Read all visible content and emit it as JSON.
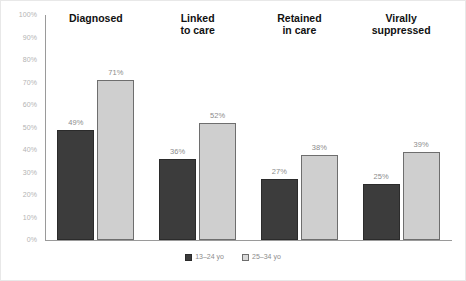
{
  "chart_data": {
    "type": "bar",
    "title": "",
    "subtitle": "",
    "xlabel": "",
    "ylabel": "",
    "ylim": [
      0,
      100
    ],
    "grid": false,
    "legend_position": "bottom-center",
    "ytick_labels": [
      "100%",
      "90%",
      "80%",
      "70%",
      "60%",
      "50%",
      "40%",
      "30%",
      "20%",
      "10%",
      "0%"
    ],
    "ytick_values": [
      100,
      90,
      80,
      70,
      60,
      50,
      40,
      30,
      20,
      10,
      0
    ],
    "categories": [
      "Diagnosed",
      "Linked\nto care",
      "Retained\nin care",
      "Virally\nsuppressed"
    ],
    "series": [
      {
        "name": "13–24 yo",
        "color": "#3c3c3c",
        "values": [
          49,
          36,
          27,
          25
        ],
        "labels": [
          "49%",
          "36%",
          "27%",
          "25%"
        ]
      },
      {
        "name": "25–34 yo",
        "color": "#cfcfcf",
        "values": [
          71,
          52,
          38,
          39
        ],
        "labels": [
          "71%",
          "52%",
          "38%",
          "39%"
        ]
      }
    ]
  },
  "legend": {
    "items": [
      {
        "label": "13–24 yo"
      },
      {
        "label": "25–34 yo"
      }
    ]
  },
  "colors": {
    "series_13_24": "#3c3c3c",
    "series_25_34": "#cfcfcf",
    "axis": "#9a9a9a",
    "tick_text": "#b3b3b3",
    "data_label_text": "#8c8c8c",
    "category_title_text": "#111111",
    "background": "#ffffff"
  }
}
